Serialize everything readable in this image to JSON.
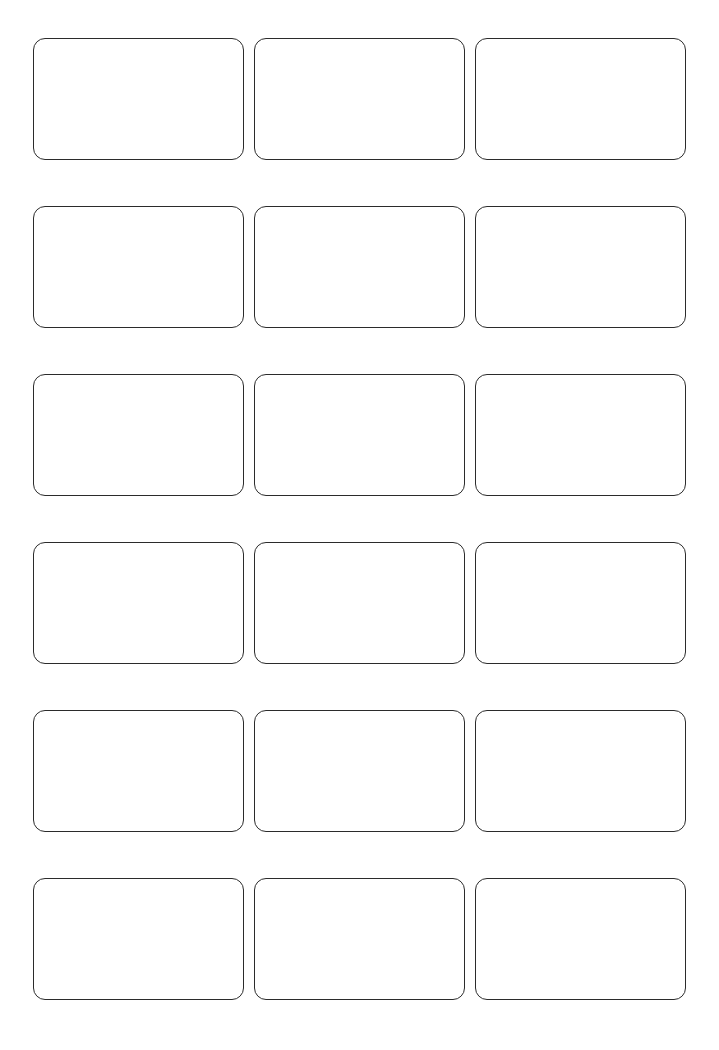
{
  "page": {
    "kind": "blank-card-template-sheet",
    "background_color": "#ffffff",
    "width": 719,
    "height": 1050
  },
  "grid": {
    "columns": 3,
    "rows": 6,
    "card_count": 18,
    "card_width": 211,
    "card_height": 122,
    "column_gap": 10,
    "row_gap": 46,
    "margin_left": 33,
    "margin_top": 38,
    "margin_right": 38,
    "margin_bottom": 47
  },
  "card_style": {
    "border_color": "#2b2b2b",
    "border_width": 1.8,
    "border_radius": 12,
    "fill_color": "#ffffff"
  },
  "cards": [
    {
      "row": 1,
      "column": 1,
      "label": ""
    },
    {
      "row": 1,
      "column": 2,
      "label": ""
    },
    {
      "row": 1,
      "column": 3,
      "label": ""
    },
    {
      "row": 2,
      "column": 1,
      "label": ""
    },
    {
      "row": 2,
      "column": 2,
      "label": ""
    },
    {
      "row": 2,
      "column": 3,
      "label": ""
    },
    {
      "row": 3,
      "column": 1,
      "label": ""
    },
    {
      "row": 3,
      "column": 2,
      "label": ""
    },
    {
      "row": 3,
      "column": 3,
      "label": ""
    },
    {
      "row": 4,
      "column": 1,
      "label": ""
    },
    {
      "row": 4,
      "column": 2,
      "label": ""
    },
    {
      "row": 4,
      "column": 3,
      "label": ""
    },
    {
      "row": 5,
      "column": 1,
      "label": ""
    },
    {
      "row": 5,
      "column": 2,
      "label": ""
    },
    {
      "row": 5,
      "column": 3,
      "label": ""
    },
    {
      "row": 6,
      "column": 1,
      "label": ""
    },
    {
      "row": 6,
      "column": 2,
      "label": ""
    },
    {
      "row": 6,
      "column": 3,
      "label": ""
    }
  ]
}
